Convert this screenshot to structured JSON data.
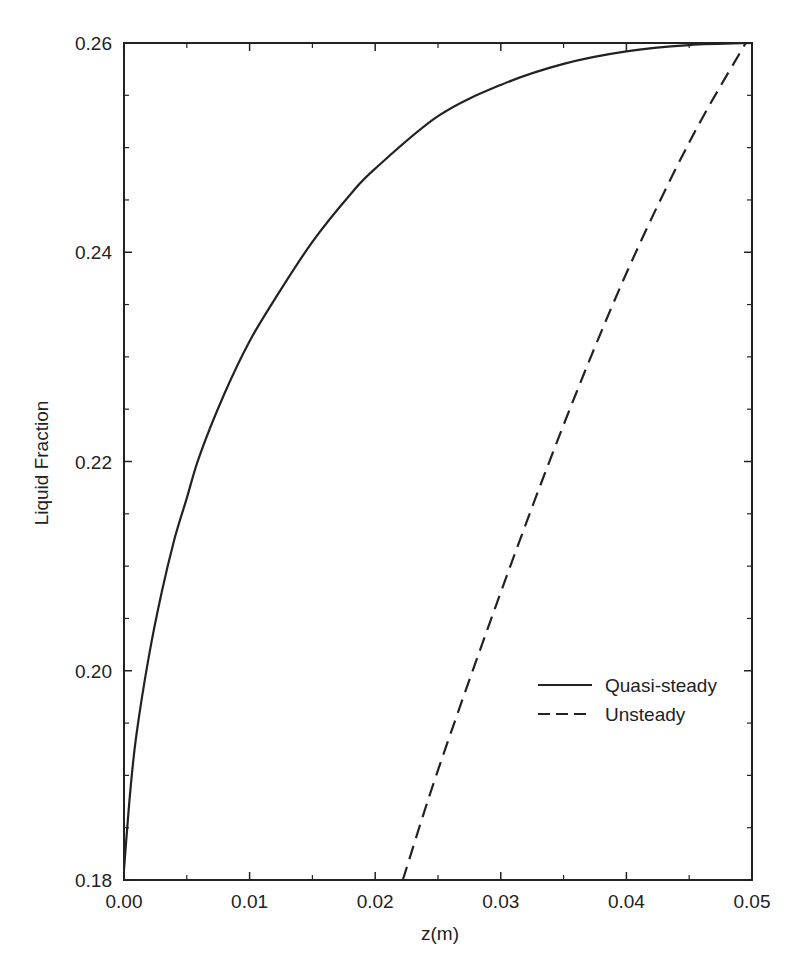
{
  "chart_data": {
    "type": "line",
    "title": "",
    "xlabel": "z(m)",
    "ylabel": "Liquid Fraction",
    "xlim": [
      0.0,
      0.05
    ],
    "ylim": [
      0.18,
      0.26
    ],
    "grid": false,
    "legend_position": "center-right",
    "x_ticks": [
      "0.00",
      "0.01",
      "0.02",
      "0.03",
      "0.04",
      "0.05"
    ],
    "x_tick_values": [
      0.0,
      0.01,
      0.02,
      0.03,
      0.04,
      0.05
    ],
    "x_minor_tick_values": [
      0.005,
      0.015,
      0.025,
      0.035,
      0.045
    ],
    "y_ticks": [
      "0.18",
      "0.20",
      "0.22",
      "0.24",
      "0.26"
    ],
    "y_tick_values": [
      0.18,
      0.2,
      0.22,
      0.24,
      0.26
    ],
    "y_minor_tick_values": [
      0.185,
      0.19,
      0.195,
      0.205,
      0.21,
      0.215,
      0.225,
      0.23,
      0.235,
      0.245,
      0.25,
      0.255
    ],
    "series": [
      {
        "name": "Quasi-steady",
        "style": "solid",
        "x": [
          0.0,
          0.0005,
          0.001,
          0.002,
          0.003,
          0.004,
          0.005,
          0.006,
          0.008,
          0.01,
          0.012,
          0.015,
          0.018,
          0.02,
          0.025,
          0.03,
          0.035,
          0.04,
          0.045,
          0.05
        ],
        "y": [
          0.181,
          0.1885,
          0.194,
          0.2015,
          0.2075,
          0.2125,
          0.2165,
          0.2205,
          0.2265,
          0.2315,
          0.2355,
          0.241,
          0.2455,
          0.248,
          0.253,
          0.256,
          0.258,
          0.2592,
          0.2598,
          0.26
        ]
      },
      {
        "name": "Unsteady",
        "style": "dashed",
        "x": [
          0.0222,
          0.025,
          0.03,
          0.035,
          0.04,
          0.045,
          0.0495
        ],
        "y": [
          0.18,
          0.1905,
          0.2075,
          0.2235,
          0.238,
          0.2505,
          0.26
        ]
      }
    ]
  },
  "legend": {
    "items": [
      {
        "label": "Quasi-steady",
        "style": "solid"
      },
      {
        "label": "Unsteady",
        "style": "dashed"
      }
    ]
  },
  "colors": {
    "line": "#222222",
    "axes": "#222222",
    "background": "#ffffff"
  }
}
